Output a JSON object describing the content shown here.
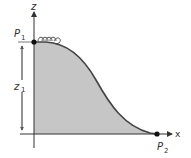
{
  "diagram": {
    "type": "roller-coaster-profile",
    "labels": {
      "z_axis": "z",
      "x_axis": "x",
      "p1": "P",
      "p1_sub": "1",
      "p2": "P",
      "p2_sub": "2",
      "height": "z",
      "height_sub": "1"
    },
    "colors": {
      "fill": "#c6c6c6",
      "curve": "#444444",
      "axis": "#333333",
      "background": "#ffffff"
    },
    "points": {
      "p1": [
        34,
        42
      ],
      "p2": [
        157,
        134
      ]
    }
  }
}
